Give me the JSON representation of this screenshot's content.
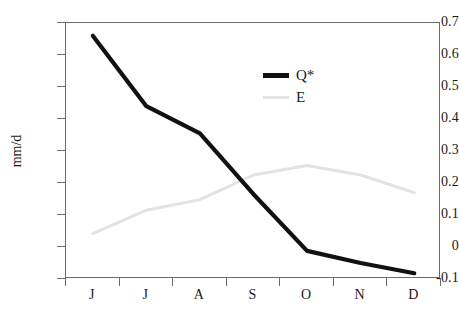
{
  "chart_data": {
    "type": "line",
    "title": "",
    "xlabel": "",
    "ylabel": "mm/d",
    "categories": [
      "J",
      "J",
      "A",
      "S",
      "O",
      "N",
      "D"
    ],
    "ylim": [
      -0.1,
      0.7
    ],
    "yticks": [
      0.7,
      0.6,
      0.5,
      0.4,
      0.3,
      0.2,
      0.1,
      0,
      -0.1
    ],
    "ytick_labels": [
      "0.7",
      "0.6",
      "0.5",
      "0.4",
      "0.3",
      "0.2",
      "0.1",
      "0",
      "-0.1"
    ],
    "grid": false,
    "legend_position": "upper-center-right",
    "series": [
      {
        "name": "Q*",
        "color": "#111111",
        "line_width": 4.2,
        "values": [
          0.66,
          0.44,
          0.355,
          0.165,
          -0.012,
          -0.05,
          -0.082
        ]
      },
      {
        "name": "E",
        "color": "#e3e3e3",
        "line_width": 3.0,
        "values": [
          0.042,
          0.115,
          0.148,
          0.225,
          0.255,
          0.225,
          0.17
        ]
      }
    ]
  },
  "axes": {
    "y_title": "mm/d",
    "axis_color": "#6b6b6b",
    "tick_color": "#6b6b6b",
    "text_color": "#1a1a1a"
  },
  "legend": {
    "entries": [
      {
        "label": "Q*",
        "color": "#111111",
        "thickness": "5px"
      },
      {
        "label": "E",
        "color": "#e3e3e3",
        "thickness": "3px"
      }
    ]
  },
  "figure": {
    "background": "#ffffff",
    "width": 459,
    "height": 309
  }
}
